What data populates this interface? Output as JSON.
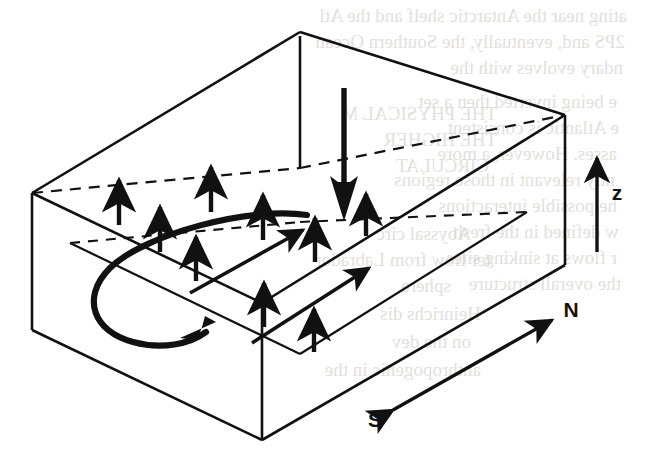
{
  "figure": {
    "type": "line-diagram",
    "background_color": "#ffffff",
    "ink_color": "#111111",
    "canvas": {
      "width": 647,
      "height": 458
    }
  },
  "labels": {
    "z_axis": "z",
    "north": "N",
    "south": "S"
  },
  "box": {
    "name": "three-dimensional-domain-box",
    "solid_edges": [
      {
        "id": "top-back-left",
        "x1": 300,
        "y1": 32,
        "x2": 32,
        "y2": 193
      },
      {
        "id": "top-back-right",
        "x1": 300,
        "y1": 32,
        "x2": 565,
        "y2": 115
      },
      {
        "id": "top-front-left",
        "x1": 32,
        "y1": 193,
        "x2": 262,
        "y2": 303
      },
      {
        "id": "top-front-right",
        "x1": 262,
        "y1": 303,
        "x2": 565,
        "y2": 115
      },
      {
        "id": "left-vertical",
        "x1": 32,
        "y1": 193,
        "x2": 32,
        "y2": 330
      },
      {
        "id": "front-vertical",
        "x1": 262,
        "y1": 303,
        "x2": 262,
        "y2": 440
      },
      {
        "id": "right-vertical",
        "x1": 565,
        "y1": 115,
        "x2": 565,
        "y2": 265
      },
      {
        "id": "center-vertical",
        "x1": 300,
        "y1": 32,
        "x2": 300,
        "y2": 168
      },
      {
        "id": "bottom-front-left",
        "x1": 32,
        "y1": 330,
        "x2": 262,
        "y2": 440
      },
      {
        "id": "bottom-front-right",
        "x1": 262,
        "y1": 440,
        "x2": 565,
        "y2": 265
      }
    ],
    "hidden_edges": [
      {
        "id": "hidden-back-left",
        "x1": 32,
        "y1": 193,
        "x2": 300,
        "y2": 168
      },
      {
        "id": "hidden-back-right",
        "x1": 300,
        "y1": 168,
        "x2": 565,
        "y2": 115
      },
      {
        "id": "hidden-vertical",
        "x1": 300,
        "y1": 32,
        "x2": 300,
        "y2": 168
      }
    ],
    "interior_plane": {
      "id": "mid-depth-isopycnal-plane",
      "solid_edges": [
        {
          "x1": 72,
          "y1": 243,
          "x2": 300,
          "y2": 353
        },
        {
          "x1": 300,
          "y1": 353,
          "x2": 525,
          "y2": 213
        }
      ],
      "dashed_edges": [
        {
          "x1": 72,
          "y1": 243,
          "x2": 300,
          "y2": 222
        },
        {
          "x1": 300,
          "y1": 222,
          "x2": 525,
          "y2": 213
        }
      ]
    }
  },
  "arrows": {
    "upwelling": [
      {
        "id": "upwelling-1",
        "x": 119,
        "y_tail": 225,
        "y_head": 176
      },
      {
        "id": "upwelling-2",
        "x": 160,
        "y_tail": 252,
        "y_head": 203
      },
      {
        "id": "upwelling-3",
        "x": 196,
        "y_tail": 281,
        "y_head": 233
      },
      {
        "id": "upwelling-4",
        "x": 211,
        "y_tail": 212,
        "y_head": 163
      },
      {
        "id": "upwelling-5",
        "x": 263,
        "y_tail": 240,
        "y_head": 191
      },
      {
        "id": "upwelling-6",
        "x": 264,
        "y_tail": 327,
        "y_head": 279
      },
      {
        "id": "upwelling-7",
        "x": 315,
        "y_tail": 262,
        "y_head": 214
      },
      {
        "id": "upwelling-8",
        "x": 314,
        "y_tail": 352,
        "y_head": 305
      },
      {
        "id": "upwelling-9",
        "x": 366,
        "y_tail": 236,
        "y_head": 190
      }
    ],
    "downwelling": {
      "id": "deep-water-formation-arrow",
      "x": 344,
      "y_tail": 88,
      "y_head": 220,
      "shaft_width": 5,
      "head_width": 26,
      "head_length": 42
    },
    "horizontal_flow": [
      {
        "id": "poleward-flow-1",
        "x1": 190,
        "y1": 293,
        "x2": 306,
        "y2": 228
      },
      {
        "id": "poleward-flow-2",
        "x1": 252,
        "y1": 343,
        "x2": 372,
        "y2": 266
      }
    ],
    "overturning_loop": {
      "id": "overturning-circulation-loop",
      "path": "M 305 217 C 240 208, 140 238, 108 270 C 80 298, 92 330, 130 341 C 160 350, 190 344, 208 330",
      "head_at": {
        "x": 212,
        "y": 327
      },
      "head_angle_deg": -36
    },
    "axis_z": {
      "id": "z-axis-arrow",
      "x": 597,
      "y_tail": 252,
      "y_head": 152
    },
    "north_south": {
      "id": "north-south-axis-arrow",
      "x1": 390,
      "y1": 412,
      "x2": 556,
      "y2": 317
    }
  },
  "background_page_text": [
    {
      "text": "ating near the Antarctic shelf and the Atl",
      "x": 180,
      "y": 22
    },
    {
      "text": "2PS and, eventually, the Southern Ocean",
      "x": 178,
      "y": 48
    },
    {
      "text": "ndary evolves with the",
      "x": 176,
      "y": 74
    },
    {
      "text": "e being inverted then a set",
      "x": 168,
      "y": 108
    },
    {
      "text": "e Atlantic is consistent",
      "x": 172,
      "y": 134
    },
    {
      "text": "asses. However, a more",
      "x": 170,
      "y": 160
    },
    {
      "text": "ntly relevant in those regions",
      "x": 166,
      "y": 186
    },
    {
      "text": "he possible interactions",
      "x": 168,
      "y": 212
    },
    {
      "text": "w defined in the fresh",
      "x": 172,
      "y": 238
    },
    {
      "text": "r flows at sinking sites",
      "x": 170,
      "y": 264
    },
    {
      "text": "the overall structure",
      "x": 174,
      "y": 290
    },
    {
      "text": "THE PHYSICAL M",
      "x": 386,
      "y": 120
    },
    {
      "text": "THE HIGHER",
      "x": 392,
      "y": 146
    },
    {
      "text": "CIRCULAT",
      "x": 400,
      "y": 172
    },
    {
      "text": "Abyssal circ",
      "x": 384,
      "y": 240
    },
    {
      "text": "ter flow from Labrador",
      "x": 376,
      "y": 266
    },
    {
      "text": "sphere",
      "x": 420,
      "y": 292
    },
    {
      "text": "Heinrichs dis",
      "x": 388,
      "y": 320
    },
    {
      "text": "on the dev",
      "x": 390,
      "y": 348
    },
    {
      "text": "anthropogenic in the",
      "x": 382,
      "y": 376
    }
  ]
}
